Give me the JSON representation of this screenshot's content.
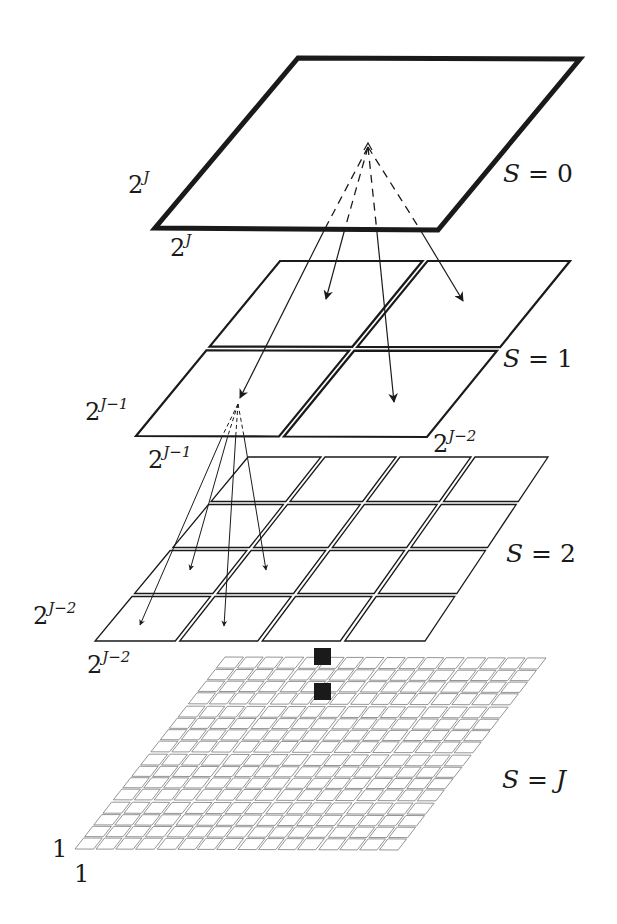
{
  "diagram": {
    "colors": {
      "stroke": "#1a1a1a",
      "fine_grid": "#7a7a7a",
      "background": "#ffffff",
      "marker_fill": "#1a1a1a"
    },
    "levels": [
      {
        "id": "S0",
        "scale_label": "S = 0",
        "divisions": 1,
        "corners": {
          "tl": [
            298,
            58
          ],
          "tr": [
            580,
            59
          ],
          "br": [
            438,
            230
          ],
          "bl": [
            155,
            228
          ]
        },
        "stroke_width": 5,
        "gap": 0,
        "side_label_left": {
          "base": "2",
          "exp": "J",
          "x": 128,
          "y": 193
        },
        "side_label_bottom": {
          "base": "2",
          "exp": "J",
          "x": 170,
          "y": 256
        },
        "scale_label_pos": [
          503,
          182
        ]
      },
      {
        "id": "S1",
        "scale_label": "S = 1",
        "divisions": 2,
        "corners": {
          "tl": [
            280,
            261
          ],
          "tr": [
            570,
            261
          ],
          "br": [
            427,
            437
          ],
          "bl": [
            136,
            436
          ]
        },
        "stroke_width": 2.2,
        "gap": 5,
        "side_label_left": {
          "base": "2",
          "exp": "J−1",
          "x": 85,
          "y": 420
        },
        "side_label_bottom": {
          "base": "2",
          "exp": "J−1",
          "x": 148,
          "y": 468
        },
        "extra_label": {
          "base": "2",
          "exp": "J−2",
          "x": 433,
          "y": 452
        },
        "scale_label_pos": [
          503,
          367
        ]
      },
      {
        "id": "S2",
        "scale_label": "S = 2",
        "divisions": 4,
        "corners": {
          "tl": [
            248,
            457
          ],
          "tr": [
            548,
            457
          ],
          "br": [
            425,
            641
          ],
          "bl": [
            95,
            641
          ]
        },
        "stroke_width": 1.3,
        "gap": 4,
        "side_label_left": {
          "base": "2",
          "exp": "J−2",
          "x": 33,
          "y": 624
        },
        "side_label_bottom": {
          "base": "2",
          "exp": "J−2",
          "x": 87,
          "y": 673
        },
        "scale_label_pos": [
          506,
          562
        ]
      },
      {
        "id": "SJ",
        "scale_label": "S = J",
        "divisions": 4,
        "sub_divisions": 4,
        "corners": {
          "tl": [
            225,
            657
          ],
          "tr": [
            546,
            658
          ],
          "br": [
            398,
            850
          ],
          "bl": [
            75,
            849
          ]
        },
        "stroke_width": 0.8,
        "gap": 3,
        "side_label_left": {
          "text": "1",
          "x": 52,
          "y": 857
        },
        "side_label_bottom": {
          "text": "1",
          "x": 74,
          "y": 882
        },
        "scale_label_pos": [
          502,
          788
        ]
      }
    ],
    "arrow_groups": [
      {
        "from_level": "S0",
        "apex": [
          368,
          143
        ],
        "dash_end_y": 228,
        "targets": [
          [
            326,
            299
          ],
          [
            463,
            301
          ],
          [
            394,
            402
          ],
          [
            240,
            398
          ]
        ]
      },
      {
        "from_level": "S1",
        "apex": [
          238,
          400
        ],
        "dash_end_y": 436,
        "targets": [
          [
            140,
            625
          ],
          [
            190,
            570
          ],
          [
            224,
            626
          ],
          [
            266,
            570
          ]
        ]
      }
    ],
    "markers": [
      {
        "name": "parent-pixel-marker",
        "x": 314,
        "y": 648,
        "w": 17,
        "h": 17
      },
      {
        "name": "child-pixel-marker",
        "x": 314,
        "y": 683,
        "w": 17,
        "h": 17
      }
    ]
  }
}
